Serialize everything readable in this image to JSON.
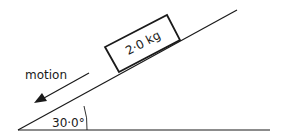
{
  "diagram": {
    "block_label": "2·0 kg",
    "motion_label": "motion",
    "angle_label": "30·0°",
    "colors": {
      "line": "#1a1a1a",
      "background": "#ffffff"
    }
  }
}
